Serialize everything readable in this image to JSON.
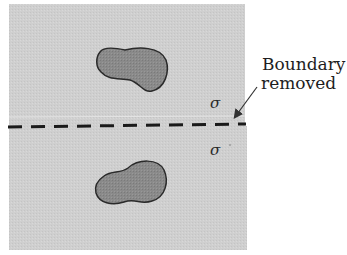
{
  "diagram": {
    "annotation": {
      "line1": "Boundary",
      "line2": "removed"
    },
    "sigma_top": "σ",
    "sigma_bottom": "σ",
    "colors": {
      "matrix": "#cfcfcf",
      "particle_fill": "#8a8a8a",
      "particle_stroke": "#2a2a2a",
      "boundary_line": "#1a1a1a",
      "arrow": "#333333",
      "background": "#ffffff"
    },
    "elements": {
      "regions": [
        "upper-grain",
        "lower-grain"
      ],
      "particles": [
        "upper-particle",
        "lower-particle"
      ],
      "boundary": "dashed-boundary"
    }
  }
}
